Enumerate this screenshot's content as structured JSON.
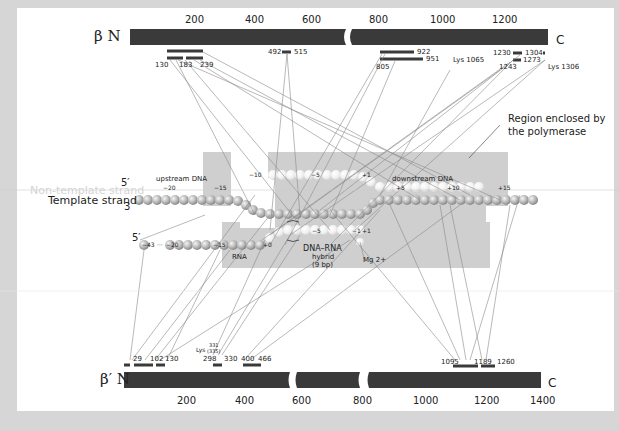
{
  "beta": {
    "label": "β N",
    "c_label": "C",
    "ticks": [
      {
        "label": "200",
        "x": 219
      },
      {
        "label": "400",
        "x": 288
      },
      {
        "label": "600",
        "x": 355
      },
      {
        "label": "800",
        "x": 369
      },
      {
        "label": "1000",
        "x": 432
      },
      {
        "label": "1200",
        "x": 493
      }
    ],
    "regions": [
      {
        "label": "130",
        "x": 158
      },
      {
        "label": "183",
        "x": 182
      },
      {
        "label": "239",
        "x": 206
      },
      {
        "label": "492",
        "x": 270
      },
      {
        "label": "515",
        "x": 295
      },
      {
        "label": "922",
        "x": 417
      },
      {
        "label": "951",
        "x": 427
      },
      {
        "label": "805",
        "x": 378
      },
      {
        "label": "Lys 1065",
        "x": 453
      },
      {
        "label": "1230",
        "x": 493
      },
      {
        "label": "1304",
        "x": 525
      },
      {
        "label": "1273",
        "x": 522
      },
      {
        "label": "1243",
        "x": 499
      },
      {
        "label": "Lys 1306",
        "x": 548
      }
    ]
  },
  "beta_prime": {
    "label": "β′ N",
    "c_label": "C",
    "ticks": [
      {
        "label": "200",
        "x": 185
      },
      {
        "label": "400",
        "x": 243
      },
      {
        "label": "600",
        "x": 300
      },
      {
        "label": "800",
        "x": 359
      },
      {
        "label": "1000",
        "x": 425
      },
      {
        "label": "1200",
        "x": 485
      },
      {
        "label": "1400",
        "x": 550
      }
    ],
    "regions": [
      {
        "label": "29",
        "x": 133
      },
      {
        "label": "102",
        "x": 151
      },
      {
        "label": "130",
        "x": 166
      },
      {
        "label": "Lys",
        "x": 196
      },
      {
        "label": "331",
        "x": 209
      },
      {
        "label": "(335)",
        "x": 207
      },
      {
        "label": "298",
        "x": 203
      },
      {
        "label": "330",
        "x": 224
      },
      {
        "label": "400",
        "x": 241
      },
      {
        "label": "466",
        "x": 262
      },
      {
        "label": "1095",
        "x": 442
      },
      {
        "label": "1189",
        "x": 475
      },
      {
        "label": "1260",
        "x": 497
      }
    ]
  },
  "annotation": {
    "line1": "Region enclosed by",
    "line2": "the polymerase"
  },
  "strands": {
    "five_prime_top": "5′",
    "non_template": "Non-template strand",
    "template": "Template strand",
    "three_prime": "3",
    "five_prime_rna": "5′",
    "upstream": "upstream DNA",
    "downstream": "downstream DNA",
    "rna": "RNA",
    "hybrid1": "DNA–RNA",
    "hybrid2": "hybrid",
    "hybrid3": "(9 bp)",
    "mg": "Mg 2+"
  },
  "positions": {
    "m10": "−10",
    "m5": "−5",
    "p1": "+1",
    "m20": "−20",
    "m15": "−15",
    "p5": "+5",
    "p10": "+10",
    "p15": "+15",
    "rna_m43": "−43",
    "rna_dots": "···",
    "rna_m20": "−20",
    "rna_m15": "−15",
    "rna_p0": "+0",
    "rna_m5": "−5",
    "rna_m1": "−1",
    "rna_p1": "+1"
  },
  "colors": {
    "frame": "#d6d6d6",
    "bar": "#3a3a3a",
    "shade": "#cfcfcf",
    "line": "#8a8a8a"
  }
}
